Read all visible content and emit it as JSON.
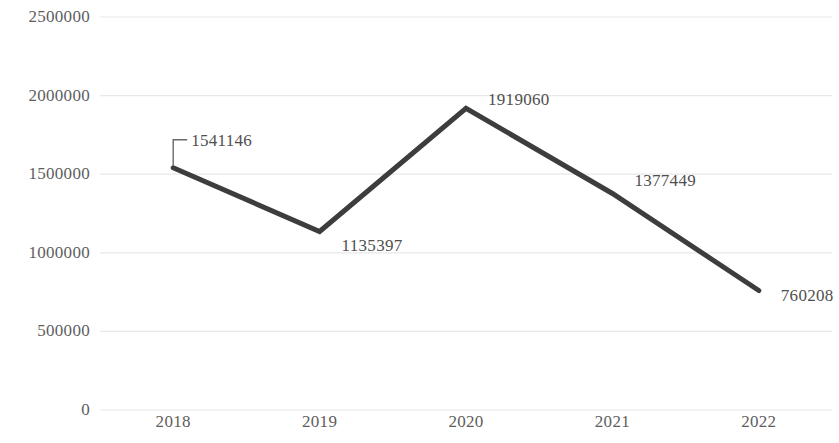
{
  "chart_data": {
    "type": "line",
    "title": "",
    "subtitle": "",
    "xlabel": "",
    "ylabel": "",
    "categories": [
      "2018",
      "2019",
      "2020",
      "2021",
      "2022"
    ],
    "values": [
      1541146,
      1135397,
      1919060,
      1377449,
      760208
    ],
    "series": [
      {
        "name": "",
        "values": [
          1541146,
          1135397,
          1919060,
          1377449,
          760208
        ]
      }
    ],
    "point_labels": [
      "1541146",
      "1135397",
      "1919060",
      "1377449",
      "760208"
    ],
    "ylim": [
      0,
      2500000
    ],
    "ytick_values": [
      2500000,
      2000000,
      1500000,
      1000000,
      500000,
      0
    ],
    "ytick_labels": [
      "2500000",
      "2000000",
      "1500000",
      "1000000",
      "500000",
      "0"
    ],
    "grid": "horizontal",
    "legend": "none",
    "line_color": "#3d3d3d",
    "gridline_color": "#e8e8e8",
    "text_color": "#5e5e5e",
    "background_color": "#ffffff"
  }
}
